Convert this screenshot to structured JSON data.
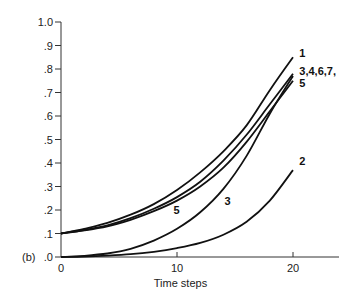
{
  "chart_data": {
    "type": "line",
    "panel_label": "(b)",
    "title": "",
    "xlabel": "Time steps",
    "ylabel": "",
    "xlim": [
      0,
      24
    ],
    "ylim": [
      0,
      1.0
    ],
    "grid": false,
    "x_ticks": [
      {
        "value": 0,
        "label": "0"
      },
      {
        "value": 10,
        "label": "10"
      },
      {
        "value": 20,
        "label": "20"
      }
    ],
    "y_ticks": [
      {
        "value": 0.0,
        "label": ".0"
      },
      {
        "value": 0.1,
        "label": ".1"
      },
      {
        "value": 0.2,
        "label": ".2"
      },
      {
        "value": 0.3,
        "label": ".3"
      },
      {
        "value": 0.4,
        "label": ".4"
      },
      {
        "value": 0.5,
        "label": ".5"
      },
      {
        "value": 0.6,
        "label": ".6"
      },
      {
        "value": 0.7,
        "label": ".7"
      },
      {
        "value": 0.8,
        "label": ".8"
      },
      {
        "value": 0.9,
        "label": ".9"
      },
      {
        "value": 1.0,
        "label": "1.0"
      }
    ],
    "x": [
      0,
      2,
      4,
      6,
      8,
      10,
      12,
      14,
      16,
      18,
      20
    ],
    "series": [
      {
        "name": "1",
        "values": [
          0.1,
          0.12,
          0.145,
          0.18,
          0.225,
          0.285,
          0.36,
          0.45,
          0.56,
          0.71,
          0.85
        ]
      },
      {
        "name": "3,4,6,7",
        "values": [
          0.1,
          0.115,
          0.135,
          0.165,
          0.205,
          0.255,
          0.32,
          0.41,
          0.52,
          0.65,
          0.78
        ]
      },
      {
        "name": "5",
        "values": [
          0.1,
          0.113,
          0.13,
          0.158,
          0.195,
          0.24,
          0.3,
          0.38,
          0.49,
          0.62,
          0.75
        ]
      },
      {
        "name": "3",
        "values": [
          0.0,
          0.005,
          0.015,
          0.035,
          0.07,
          0.12,
          0.19,
          0.29,
          0.43,
          0.61,
          0.77
        ]
      },
      {
        "name": "2",
        "values": [
          0.0,
          0.002,
          0.006,
          0.012,
          0.022,
          0.038,
          0.06,
          0.095,
          0.15,
          0.24,
          0.37
        ]
      }
    ],
    "annotations": [
      {
        "text": "1",
        "x": 20.2,
        "y": 0.87,
        "anchor": "end"
      },
      {
        "text": "3,4,6,7,",
        "x": 20.2,
        "y": 0.79,
        "anchor": "end"
      },
      {
        "text": "5",
        "x": 20.2,
        "y": 0.74,
        "anchor": "end"
      },
      {
        "text": "5",
        "x": 9.7,
        "y": 0.2,
        "anchor": "inline"
      },
      {
        "text": "3",
        "x": 14.1,
        "y": 0.24,
        "anchor": "inline"
      },
      {
        "text": "2",
        "x": 20.2,
        "y": 0.41,
        "anchor": "end"
      }
    ]
  }
}
